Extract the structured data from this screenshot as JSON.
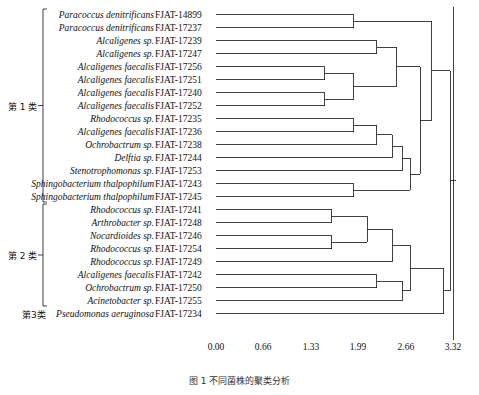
{
  "chart_data": {
    "type": "dendrogram",
    "title": "",
    "xlabel": "",
    "ylabel": "",
    "xlim": [
      0.0,
      3.32
    ],
    "tick_labels": [
      "0.00",
      "0.66",
      "1.33",
      "1.99",
      "2.66",
      "3.32"
    ],
    "tick_values": [
      0.0,
      0.66,
      1.33,
      1.99,
      2.66,
      3.32
    ],
    "grid": false,
    "legend": "none",
    "leaves": [
      {
        "name": "Paracoccus denitrificans",
        "code": "FJAT-14899",
        "group": "group1"
      },
      {
        "name": "Paracoccus denitrificans",
        "code": "FJAT-17237",
        "group": "group1"
      },
      {
        "name": "Alcaligenes sp.",
        "code": "FJAT-17239",
        "group": "group1"
      },
      {
        "name": "Alcaligenes sp.",
        "code": "FJAT-17247",
        "group": "group1"
      },
      {
        "name": "Alcaligenes faecalis",
        "code": "FJAT-17256",
        "group": "group1"
      },
      {
        "name": "Alcaligenes faecalis",
        "code": "FJAT-17251",
        "group": "group1"
      },
      {
        "name": "Alcaligenes faecalis",
        "code": "FJAT-17240",
        "group": "group1"
      },
      {
        "name": "Alcaligenes faecalis",
        "code": "FJAT-17252",
        "group": "group1"
      },
      {
        "name": "Rhodococcus sp.",
        "code": "FJAT-17235",
        "group": "group1"
      },
      {
        "name": "Alcaligenes faecalis",
        "code": "FJAT-17236",
        "group": "group1"
      },
      {
        "name": "Ochrobactrum sp.",
        "code": "FJAT-17238",
        "group": "group1"
      },
      {
        "name": "Delftia sp.",
        "code": "FJAT-17244",
        "group": "group1"
      },
      {
        "name": "Stenotrophomonas sp.",
        "code": "FJAT-17253",
        "group": "group1"
      },
      {
        "name": "Sphingobacterium thalpophilum",
        "code": "FJAT-17243",
        "group": "group1"
      },
      {
        "name": "Sphingobacterium thalpophilum",
        "code": "FJAT-17245",
        "group": "group1"
      },
      {
        "name": "Rhodococcus sp.",
        "code": "FJAT-17241",
        "group": "group2"
      },
      {
        "name": "Arthrobacter sp.",
        "code": "FJAT-17248",
        "group": "group2"
      },
      {
        "name": "Nocardioides sp.",
        "code": "FJAT-17246",
        "group": "group2"
      },
      {
        "name": "Rhodococcus sp.",
        "code": "FJAT-17254",
        "group": "group2"
      },
      {
        "name": "Rhodococcus sp.",
        "code": "FJAT-17249",
        "group": "group2"
      },
      {
        "name": "Alcaligenes faecalis",
        "code": "FJAT-17242",
        "group": "group2"
      },
      {
        "name": "Ochrobactrum sp.",
        "code": "FJAT-17250",
        "group": "group2"
      },
      {
        "name": "Acinetobacter sp.",
        "code": "FJAT-17255",
        "group": "group2"
      },
      {
        "name": "Pseudomonas aeruginosa",
        "code": "FJAT-17234",
        "group": "group3"
      }
    ],
    "merges": [
      {
        "left": {
          "leaf": 0
        },
        "right": {
          "leaf": 1
        },
        "height": 1.93
      },
      {
        "left": {
          "leaf": 2
        },
        "right": {
          "leaf": 3
        },
        "height": 2.25
      },
      {
        "left": {
          "leaf": 4
        },
        "right": {
          "leaf": 5
        },
        "height": 1.52
      },
      {
        "left": {
          "leaf": 6
        },
        "right": {
          "leaf": 7
        },
        "height": 1.52
      },
      {
        "left": {
          "node": 2
        },
        "right": {
          "node": 3
        },
        "height": 1.93
      },
      {
        "left": {
          "node": 1
        },
        "right": {
          "node": 4
        },
        "height": 2.53
      },
      {
        "left": {
          "leaf": 8
        },
        "right": {
          "leaf": 9
        },
        "height": 1.93
      },
      {
        "left": {
          "node": 6
        },
        "right": {
          "leaf": 10
        },
        "height": 2.25
      },
      {
        "left": {
          "node": 7
        },
        "right": {
          "leaf": 11
        },
        "height": 2.47
      },
      {
        "left": {
          "node": 8
        },
        "right": {
          "leaf": 12
        },
        "height": 2.61
      },
      {
        "left": {
          "leaf": 13
        },
        "right": {
          "leaf": 14
        },
        "height": 1.93
      },
      {
        "left": {
          "node": 9
        },
        "right": {
          "node": 10
        },
        "height": 2.72
      },
      {
        "left": {
          "node": 5
        },
        "right": {
          "node": 11
        },
        "height": 2.86
      },
      {
        "left": {
          "node": 0
        },
        "right": {
          "node": 12
        },
        "height": 3.02
      },
      {
        "left": {
          "leaf": 15
        },
        "right": {
          "leaf": 16
        },
        "height": 1.62
      },
      {
        "left": {
          "leaf": 17
        },
        "right": {
          "leaf": 18
        },
        "height": 1.62
      },
      {
        "left": {
          "node": 14
        },
        "right": {
          "node": 15
        },
        "height": 2.12
      },
      {
        "left": {
          "node": 16
        },
        "right": {
          "leaf": 19
        },
        "height": 2.47
      },
      {
        "left": {
          "leaf": 20
        },
        "right": {
          "leaf": 21
        },
        "height": 2.25
      },
      {
        "left": {
          "node": 18
        },
        "right": {
          "leaf": 22
        },
        "height": 2.61
      },
      {
        "left": {
          "node": 17
        },
        "right": {
          "node": 19
        },
        "height": 2.72
      },
      {
        "left": {
          "node": 20
        },
        "right": {
          "leaf": 23
        },
        "height": 3.19
      },
      {
        "left": {
          "node": 13
        },
        "right": {
          "node": 21
        },
        "height": 3.28
      }
    ]
  },
  "groups": [
    {
      "id": "group1",
      "label": "第 1 类",
      "first_leaf": 0,
      "last_leaf": 14
    },
    {
      "id": "group2",
      "label": "第 2 类",
      "first_leaf": 15,
      "last_leaf": 22
    },
    {
      "id": "group3",
      "label": "第3类",
      "first_leaf": 23,
      "last_leaf": 23
    }
  ],
  "caption": "图 1  不同菌株的聚类分析"
}
